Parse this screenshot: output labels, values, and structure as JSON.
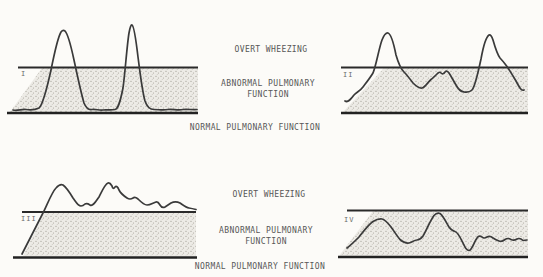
{
  "figure": {
    "colors": {
      "background": "#fcfbf8",
      "line_ink": "#2a2a2a",
      "curve_ink": "#3a3a3a",
      "stipple_base": "#edebe6",
      "stipple_dot": "#8f8b81",
      "label_text": "#575757"
    }
  },
  "zone_labels_top": {
    "overt": "OVERT WHEEZING",
    "abnormal_line1": "ABNORMAL PULMONARY",
    "abnormal_line2": "FUNCTION",
    "normal": "NORMAL PULMONARY FUNCTION"
  },
  "zone_labels_bottom": {
    "overt": "OVERT WHEEZING",
    "abnormal_line1": "ABNORMAL PULMONARY",
    "abnormal_line2": "FUNCTION",
    "normal": "NORMAL PULMONARY FUNCTION"
  },
  "panels": [
    {
      "numeral": "I",
      "band_points": "10,112 42,68 198,68 198,112",
      "curve_path": "M13,110 C17,111 22,109 26,109.5 C30,110 35,110 39,108 C43,105 47,88 51,70 C54,55 58,37 61,32 Q63,29.5 65,31 C68,34 71,46 74,60 C77,74 81,93 84,103 C86,108 89,110 92,109.5 C96,109 99,110.5 103,110 C107,109.5 111,110.5 115,109.5 C118,109 120,103 123,88 C125,74 127,45 129,33 Q130.5,24.5 132,25 C134,26 136,40 138,57 C140,72 142,90 145,101 C147,107 150,109.5 154,109.5 C159,109.5 163,110.5 168,109.5 C173,109 178,110.5 183,109.5 C188,109 193,110 197,109.5"
    },
    {
      "numeral": "II",
      "band_points": "343,112 384,68 528,68 528,112",
      "curve_path": "M345,101 C348,103 351,99 354,95 C357,92 360,91 363,87 C366,83 370,78 373,73 C376,66 379,48 382,40 Q385,32.5 388,33 C391,34 394,45 396,55 C398,62 401,69 404,72 C407,75 410,79 413,83 C416,86 419,88.5 422,88 C425,87.5 428,82 431,79.5 C433,78 436,75 438,73 Q440,71.5 441,73 Q443,75 445,72 Q447,70 449,73 C451,76 453,80 456,85 C458,89 461,91.5 464,92 C467,92.5 470,92 472,90 C475,87 478,73 481,59 C483,48 486,37 489,35 Q491,34 493,40 C495,47 497,54 500,58 C503,61 505,64 508,68 C510,71 513,76 516,81 Q518,85 520,88 Q522,91 524,90"
    },
    {
      "numeral": "III",
      "band_points": "23,256 44,213 196,213 196,256",
      "curve_path": "M22,254 L43,213 C47,205 52,192 56,188 Q60,183.5 63,185 C66,187 70,193 73,198 C76,202 78,206 81,206 Q83,206 85,204 Q87,203 90,205 C93,207 96,201 99,197 C102,191 105,184 108,183 Q110,182.5 112,186 Q113,190 115,187 Q117,185 119,190 C121,194 124,196 127,198 Q130,200 133,198 Q135,196.5 138,199 C141,202 144,205 147,205 C150,205 153,203 156,202 Q158,201.5 160,205 Q162,208.5 165,207 Q168,205 171,203 C174,201.5 177,201.5 180,203 C183,205 186,207.5 189,208 C192,208.5 194,209 196,209.5"
    },
    {
      "numeral": "IV",
      "band_points": "339,256 373,211 528,211 528,256",
      "curve_path": "M347,248 C351,245 355,241 359,237 C363,232 368,225 373,221.5 Q378,218.5 382,219 C385,219.5 388,223 391,227 C394,231 397,236 400,239.5 C403,242 406,243.5 409,243 C412,242.5 414,240 417,240 Q420,240 423,236 C426,231 430,221 434,215.5 Q437,212 440,213.5 C443,215.5 446,222 449,227 Q452,231 455,231.5 C458,232 461,239 464,245 Q466,250 469,250.5 C472,250.5 474,242 477,238 Q479,235 482,237 Q484,239 487,237 Q490,235.5 493,238 Q496,240 499,241 Q502,242 505,239.5 Q508,237.5 511,239.5 Q514,241 517,239 Q520,237.5 523,240.5 L527,240"
    }
  ]
}
